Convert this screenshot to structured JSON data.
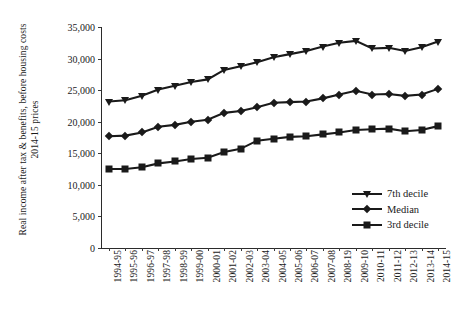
{
  "axis": {
    "y_title_line1": "Real income after tax & benefits, before housing costs",
    "y_title_line2": "2014-15 prices"
  },
  "chart_data": {
    "type": "line",
    "title": "",
    "subtitle": "",
    "xlabel": "",
    "ylabel": "Real income after tax & benefits, before housing costs 2014-15 prices",
    "ylim": [
      0,
      35000
    ],
    "yticks": [
      0,
      5000,
      10000,
      15000,
      20000,
      25000,
      30000,
      35000
    ],
    "ytick_labels": [
      "0",
      "5,000",
      "10,000",
      "15,000",
      "20,000",
      "25,000",
      "30,000",
      "35,000"
    ],
    "grid": false,
    "legend_position": "right-inside",
    "categories": [
      "1994-95",
      "1995-96",
      "1996-97",
      "1997-98",
      "1998-99",
      "1999-00",
      "2000-01",
      "2001-02",
      "2002-03",
      "2003-04",
      "2004-05",
      "2005-06",
      "2006-07",
      "2007-08",
      "2008-19",
      "2009-10",
      "2010-11",
      "2011-12",
      "2012-13",
      "2013-14",
      "2014-15"
    ],
    "series": [
      {
        "name": "7th decile",
        "marker": "triangle-down",
        "values": [
          23200,
          23400,
          24100,
          25100,
          25700,
          26300,
          26700,
          28200,
          28800,
          29400,
          30200,
          30700,
          31200,
          31900,
          32500,
          32800,
          31600,
          31700,
          31200,
          31800,
          32700
        ]
      },
      {
        "name": "Median",
        "marker": "diamond",
        "values": [
          17700,
          17800,
          18300,
          19200,
          19500,
          20000,
          20300,
          21400,
          21700,
          22300,
          23000,
          23100,
          23200,
          23700,
          24300,
          24900,
          24300,
          24400,
          24100,
          24300,
          25200
        ]
      },
      {
        "name": "3rd decile",
        "marker": "square",
        "values": [
          12500,
          12500,
          12800,
          13400,
          13700,
          14100,
          14300,
          15200,
          15700,
          17000,
          17300,
          17600,
          17700,
          18000,
          18300,
          18700,
          18800,
          18900,
          18500,
          18700,
          19300
        ]
      }
    ]
  },
  "legend": {
    "items": [
      {
        "label": "7th decile",
        "marker": "triangle-down"
      },
      {
        "label": "Median",
        "marker": "diamond"
      },
      {
        "label": "3rd decile",
        "marker": "square"
      }
    ]
  },
  "colors": {
    "series": "#1a1a1a",
    "axis": "#2b2b2b",
    "background": "#ffffff"
  }
}
